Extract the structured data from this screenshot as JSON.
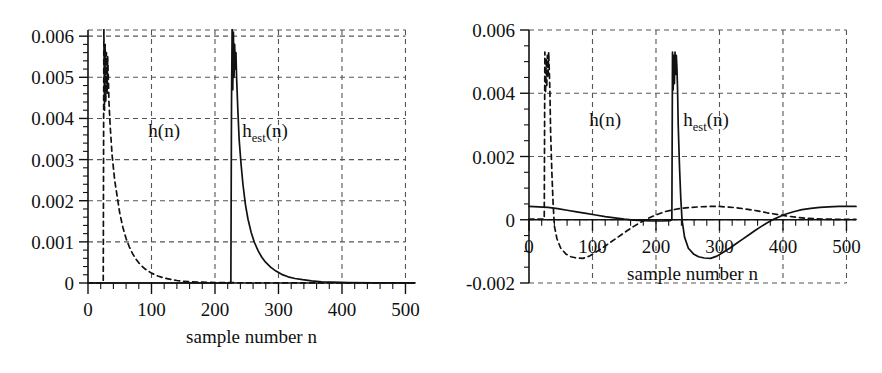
{
  "figure": {
    "background": "#ffffff",
    "ink": "#111111",
    "grid_color": "#555555"
  },
  "chart_data": [
    {
      "id": "left-panel",
      "type": "line",
      "title": "",
      "xlabel": "sample number n",
      "ylabel": "",
      "xlim": [
        0,
        515
      ],
      "ylim": [
        0,
        0.00615
      ],
      "xticks": [
        0,
        100,
        200,
        300,
        400,
        500
      ],
      "xticklabels": [
        "0",
        "100",
        "200",
        "300",
        "400",
        "500"
      ],
      "yticks": [
        0,
        0.001,
        0.002,
        0.003,
        0.004,
        0.005,
        0.006
      ],
      "yticklabels": [
        "0",
        "0.001",
        "0.002",
        "0.003",
        "0.004",
        "0.005",
        "0.006"
      ],
      "x_minor_step": 20,
      "y_minor_step": 0.0002,
      "grid": true,
      "grid_style": "dashed",
      "legend": "inline-annotations",
      "annotations": [
        {
          "text": "h(n)",
          "sub": "",
          "x": 95,
          "y": 0.00355
        },
        {
          "text": "h",
          "sub": "est",
          "tail": "(n)",
          "x": 243,
          "y": 0.00355
        }
      ],
      "series": [
        {
          "name": "h(n)",
          "style": "dashed",
          "description": "zero until n=25, near-vertical rise with oscillatory burst to 0.0055-0.006 around n=27-32, then exponential decay to ~0 by n=170",
          "points": [
            [
              0,
              0.0
            ],
            [
              24,
              0.0
            ],
            [
              25,
              0.0062
            ],
            [
              26,
              0.0042
            ],
            [
              27,
              0.0058
            ],
            [
              28,
              0.0044
            ],
            [
              29,
              0.0056
            ],
            [
              30,
              0.0046
            ],
            [
              31,
              0.0055
            ],
            [
              32,
              0.005
            ],
            [
              33,
              0.0044
            ],
            [
              35,
              0.0038
            ],
            [
              38,
              0.0031
            ],
            [
              42,
              0.0025
            ],
            [
              46,
              0.0021
            ],
            [
              50,
              0.0017
            ],
            [
              55,
              0.00135
            ],
            [
              60,
              0.00108
            ],
            [
              65,
              0.00088
            ],
            [
              70,
              0.00072
            ],
            [
              75,
              0.00059
            ],
            [
              80,
              0.00049
            ],
            [
              85,
              0.00041
            ],
            [
              90,
              0.00034
            ],
            [
              100,
              0.00024
            ],
            [
              110,
              0.00017
            ],
            [
              120,
              0.00012
            ],
            [
              130,
              9e-05
            ],
            [
              140,
              6e-05
            ],
            [
              150,
              4e-05
            ],
            [
              165,
              3e-05
            ],
            [
              180,
              2e-05
            ],
            [
              200,
              1e-05
            ],
            [
              250,
              5e-06
            ],
            [
              300,
              3e-06
            ],
            [
              400,
              2e-06
            ],
            [
              515,
              1e-06
            ]
          ]
        },
        {
          "name": "h_est(n)",
          "style": "solid",
          "description": "zero until n=226, near-vertical rise with oscillatory burst reaching above 0.006 clipping at top around n=228-233, then exponential decay to ~0 by n=380",
          "points": [
            [
              0,
              0.0
            ],
            [
              225,
              0.0
            ],
            [
              226,
              0.0043
            ],
            [
              227,
              0.0062
            ],
            [
              228,
              0.0047
            ],
            [
              229,
              0.0061
            ],
            [
              230,
              0.005
            ],
            [
              231,
              0.0058
            ],
            [
              232,
              0.0052
            ],
            [
              233,
              0.0056
            ],
            [
              234,
              0.005
            ],
            [
              236,
              0.0042
            ],
            [
              238,
              0.0035
            ],
            [
              241,
              0.0029
            ],
            [
              244,
              0.0024
            ],
            [
              248,
              0.0019
            ],
            [
              252,
              0.00155
            ],
            [
              257,
              0.00123
            ],
            [
              262,
              0.00099
            ],
            [
              268,
              0.00078
            ],
            [
              274,
              0.00062
            ],
            [
              280,
              0.0005
            ],
            [
              288,
              0.00038
            ],
            [
              296,
              0.00029
            ],
            [
              305,
              0.00021
            ],
            [
              315,
              0.00015
            ],
            [
              326,
              0.00011
            ],
            [
              338,
              8e-05
            ],
            [
              352,
              5e-05
            ],
            [
              368,
              3e-05
            ],
            [
              385,
              2e-05
            ],
            [
              410,
              1e-05
            ],
            [
              450,
              6e-06
            ],
            [
              515,
              4e-06
            ]
          ]
        }
      ]
    },
    {
      "id": "right-panel",
      "type": "line",
      "title": "",
      "xlabel": "sample number n",
      "ylabel": "",
      "xlim": [
        0,
        515
      ],
      "ylim": [
        -0.002,
        0.006
      ],
      "xticks": [
        0,
        100,
        200,
        300,
        400,
        500
      ],
      "xticklabels": [
        "0",
        "100",
        "200",
        "300",
        "400",
        "500"
      ],
      "yticks": [
        -0.002,
        0,
        0.002,
        0.004,
        0.006
      ],
      "yticklabels": [
        "-0.002",
        "0",
        "0.002",
        "0.004",
        "0.006"
      ],
      "x_minor_step": 20,
      "y_minor_step": 0.0005,
      "grid": true,
      "grid_style": "dashed",
      "legend": "inline-annotations",
      "annotations": [
        {
          "text": "h(n)",
          "sub": "",
          "x": 95,
          "y": 0.00295
        },
        {
          "text": "h",
          "sub": "est",
          "tail": "(n)",
          "x": 243,
          "y": 0.00295
        }
      ],
      "series": [
        {
          "name": "h(n)",
          "style": "dashed",
          "description": "flat near 0 until n=25, vertical oscillatory burst to 0.0053, falls through zero, trough about -0.0012 near n=85, rises crossing zero near n=175, broad positive lobe peaking 0.0004 near n=300, decays toward 0 by n=480",
          "points": [
            [
              0,
              2e-05
            ],
            [
              24,
              2e-05
            ],
            [
              25,
              0.0053
            ],
            [
              26,
              0.004
            ],
            [
              27,
              0.0051
            ],
            [
              28,
              0.0042
            ],
            [
              29,
              0.0052
            ],
            [
              30,
              0.0045
            ],
            [
              31,
              0.0053
            ],
            [
              32,
              0.0047
            ],
            [
              33,
              0.004
            ],
            [
              34,
              0.0028
            ],
            [
              36,
              0.0015
            ],
            [
              38,
              0.0005
            ],
            [
              40,
              -0.0002
            ],
            [
              44,
              -0.0006
            ],
            [
              50,
              -0.0009
            ],
            [
              58,
              -0.00108
            ],
            [
              66,
              -0.00117
            ],
            [
              75,
              -0.00121
            ],
            [
              85,
              -0.00122
            ],
            [
              95,
              -0.00115
            ],
            [
              105,
              -0.00103
            ],
            [
              115,
              -0.0009
            ],
            [
              125,
              -0.00076
            ],
            [
              135,
              -0.00062
            ],
            [
              145,
              -0.00048
            ],
            [
              155,
              -0.00034
            ],
            [
              165,
              -0.00021
            ],
            [
              175,
              -9e-05
            ],
            [
              185,
              2e-05
            ],
            [
              195,
              0.00011
            ],
            [
              205,
              0.00019
            ],
            [
              215,
              0.00026
            ],
            [
              228,
              0.00032
            ],
            [
              240,
              0.00036
            ],
            [
              255,
              0.00039
            ],
            [
              270,
              0.00041
            ],
            [
              285,
              0.00042
            ],
            [
              300,
              0.00042
            ],
            [
              315,
              0.0004
            ],
            [
              330,
              0.00037
            ],
            [
              345,
              0.00033
            ],
            [
              360,
              0.00028
            ],
            [
              375,
              0.00022
            ],
            [
              390,
              0.00017
            ],
            [
              405,
              0.00012
            ],
            [
              420,
              8e-05
            ],
            [
              435,
              5e-05
            ],
            [
              450,
              3e-05
            ],
            [
              470,
              2e-05
            ],
            [
              490,
              1e-05
            ],
            [
              515,
              1e-05
            ]
          ]
        },
        {
          "name": "h_est(n)",
          "style": "solid",
          "description": "starts at 0.0004, decays slowly crossing near zero at n=160, flat near zero to n=226, vertical oscillatory burst to 0.0053, falls through zero, trough about -0.0012 near n=285, rises crossing zero near n=375, settles at 0.0004 by n=470",
          "points": [
            [
              0,
              0.00042
            ],
            [
              15,
              0.00041
            ],
            [
              30,
              0.00039
            ],
            [
              45,
              0.00035
            ],
            [
              60,
              0.0003
            ],
            [
              75,
              0.00025
            ],
            [
              90,
              0.0002
            ],
            [
              105,
              0.00015
            ],
            [
              120,
              0.0001
            ],
            [
              135,
              6e-05
            ],
            [
              150,
              2e-05
            ],
            [
              165,
              -1e-05
            ],
            [
              180,
              -3e-05
            ],
            [
              195,
              -4e-05
            ],
            [
              210,
              -4e-05
            ],
            [
              222,
              -3e-05
            ],
            [
              225,
              0.0
            ],
            [
              226,
              0.0053
            ],
            [
              227,
              0.0041
            ],
            [
              228,
              0.0052
            ],
            [
              229,
              0.0043
            ],
            [
              230,
              0.0053
            ],
            [
              231,
              0.0046
            ],
            [
              232,
              0.0052
            ],
            [
              233,
              0.0048
            ],
            [
              234,
              0.0041
            ],
            [
              235,
              0.003
            ],
            [
              237,
              0.0017
            ],
            [
              239,
              0.0007
            ],
            [
              241,
              0.0
            ],
            [
              245,
              -0.00055
            ],
            [
              251,
              -0.0009
            ],
            [
              259,
              -0.00108
            ],
            [
              267,
              -0.00117
            ],
            [
              276,
              -0.00121
            ],
            [
              286,
              -0.00122
            ],
            [
              296,
              -0.00115
            ],
            [
              306,
              -0.00103
            ],
            [
              316,
              -0.0009
            ],
            [
              326,
              -0.00076
            ],
            [
              336,
              -0.00062
            ],
            [
              346,
              -0.00048
            ],
            [
              356,
              -0.00034
            ],
            [
              366,
              -0.00021
            ],
            [
              376,
              -9e-05
            ],
            [
              386,
              2e-05
            ],
            [
              396,
              0.00011
            ],
            [
              406,
              0.00019
            ],
            [
              418,
              0.00026
            ],
            [
              430,
              0.00032
            ],
            [
              444,
              0.00036
            ],
            [
              458,
              0.00039
            ],
            [
              472,
              0.00041
            ],
            [
              488,
              0.00042
            ],
            [
              515,
              0.00042
            ]
          ]
        }
      ]
    }
  ]
}
